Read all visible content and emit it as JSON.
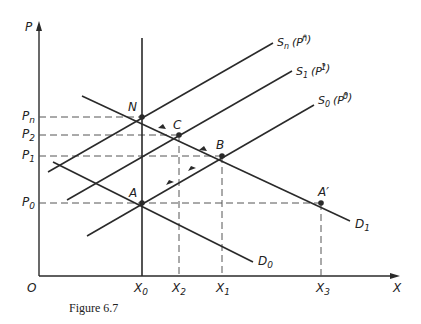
{
  "figure": {
    "caption": "Figure 6.7",
    "axes": {
      "y_label": "P",
      "x_label": "X",
      "origin_label": "O"
    },
    "price_labels": [
      {
        "main": "P",
        "sub": "n"
      },
      {
        "main": "P",
        "sub": "2"
      },
      {
        "main": "P",
        "sub": "1"
      },
      {
        "main": "P",
        "sub": "0"
      }
    ],
    "quantity_labels": [
      {
        "main": "X",
        "sub": "0"
      },
      {
        "main": "X",
        "sub": "2"
      },
      {
        "main": "X",
        "sub": "1"
      },
      {
        "main": "X",
        "sub": "3"
      }
    ],
    "curves": {
      "Sn": {
        "main": "S",
        "sub": "n",
        "paren": "(P",
        "psub": "n",
        "pstar": "*",
        "close": ")"
      },
      "S1": {
        "main": "S",
        "sub": "1",
        "paren": "(P",
        "psub": "1",
        "pstar": "*",
        "close": ")"
      },
      "S0": {
        "main": "S",
        "sub": "0",
        "paren": "(P",
        "psub": "0",
        "pstar": "*",
        "close": ")"
      },
      "D0": {
        "main": "D",
        "sub": "0"
      },
      "D1": {
        "main": "D",
        "sub": "1"
      }
    },
    "points": {
      "N": "N",
      "C": "C",
      "B": "B",
      "A": "A",
      "A_prime": "A′"
    },
    "colors": {
      "line": "#2a2a2a",
      "dashed": "#555555",
      "background": "#ffffff"
    }
  }
}
